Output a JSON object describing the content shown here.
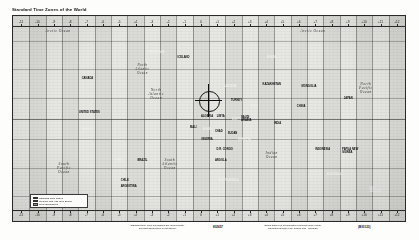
{
  "page": {
    "title": "Standard Time Zones of the World",
    "background_color": "#fdfdfc"
  },
  "map": {
    "frame_color": "#2a2a2a",
    "ocean_color": "#f4f4f1",
    "land_color": "#4a4a4a",
    "band_light": "#d8d8d4",
    "band_dark": "#bdbdb8",
    "projection_note": "Mercator-style world map with vertical time zone bands"
  },
  "axis": {
    "top_labels": [
      "-11",
      "-10",
      "-9",
      "-8",
      "-7",
      "-6",
      "-5",
      "-4",
      "-3",
      "-2",
      "-1",
      "0",
      "+1",
      "+2",
      "+3",
      "+4",
      "+5",
      "+6",
      "+7",
      "+8",
      "+9",
      "+10",
      "+11",
      "+12"
    ],
    "bottom_labels": [
      "-11",
      "-10",
      "-9",
      "-8",
      "-7",
      "-6",
      "-5",
      "-4",
      "-3",
      "-2",
      "-1",
      "0",
      "+1",
      "+2",
      "+3",
      "+4",
      "+5",
      "+6",
      "+7",
      "+8",
      "+9",
      "+10",
      "+11",
      "+12"
    ]
  },
  "ocean_labels": [
    {
      "text": "Arctic Ocean",
      "x": 11.5,
      "y": 7.5,
      "size": 3.6
    },
    {
      "text": "Arctic Ocean",
      "x": 76.5,
      "y": 7.5,
      "size": 3.6
    },
    {
      "text": "North\nPacific\nOcean",
      "x": 90.0,
      "y": 35.0,
      "size": 3.6
    },
    {
      "text": "North\nAtlantic\nOcean",
      "x": 36.5,
      "y": 38.0,
      "size": 3.6
    },
    {
      "text": "South\nPacific\nOcean",
      "x": 13.0,
      "y": 74.0,
      "size": 3.6
    },
    {
      "text": "South\nAtlantic\nOcean",
      "x": 40.0,
      "y": 72.0,
      "size": 3.6
    },
    {
      "text": "Indian\nOcean",
      "x": 66.0,
      "y": 68.0,
      "size": 3.6
    },
    {
      "text": "North\nAtlantic\nOcean",
      "x": 33.0,
      "y": 26.0,
      "size": 3.2
    }
  ],
  "country_labels": [
    {
      "text": "GREENLAND",
      "x": 36.5,
      "y": 17.5
    },
    {
      "text": "CANADA",
      "x": 19.0,
      "y": 30.0
    },
    {
      "text": "UNITED STATES",
      "x": 19.5,
      "y": 47.0
    },
    {
      "text": "MEXICO",
      "x": 19.0,
      "y": 55.0
    },
    {
      "text": "BRAZIL",
      "x": 33.0,
      "y": 70.0
    },
    {
      "text": "ARGENTINA",
      "x": 29.5,
      "y": 83.0
    },
    {
      "text": "RUSSIA",
      "x": 66.0,
      "y": 20.0
    },
    {
      "text": "CHINA",
      "x": 73.5,
      "y": 44.0
    },
    {
      "text": "INDIA",
      "x": 67.5,
      "y": 52.0
    },
    {
      "text": "AUSTRALIA",
      "x": 82.0,
      "y": 77.0
    },
    {
      "text": "ALGERIA",
      "x": 49.5,
      "y": 49.0
    },
    {
      "text": "LIBYA",
      "x": 53.0,
      "y": 49.0
    },
    {
      "text": "EGYPT",
      "x": 57.0,
      "y": 50.0
    },
    {
      "text": "SUDAN",
      "x": 56.0,
      "y": 57.0
    },
    {
      "text": "CHAD",
      "x": 52.5,
      "y": 56.0
    },
    {
      "text": "NIGER",
      "x": 49.5,
      "y": 55.0
    },
    {
      "text": "MALI",
      "x": 46.0,
      "y": 54.0
    },
    {
      "text": "NIGERIA",
      "x": 49.5,
      "y": 60.0
    },
    {
      "text": "ETHIOPIA",
      "x": 59.0,
      "y": 60.0
    },
    {
      "text": "D.R. CONGO",
      "x": 54.0,
      "y": 65.0
    },
    {
      "text": "ANGOLA",
      "x": 53.0,
      "y": 70.0
    },
    {
      "text": "SOUTH AFRICA",
      "x": 55.0,
      "y": 80.0
    },
    {
      "text": "KAZAKHSTAN",
      "x": 66.0,
      "y": 33.0
    },
    {
      "text": "MONGOLIA",
      "x": 75.5,
      "y": 34.0
    },
    {
      "text": "IRAN",
      "x": 61.5,
      "y": 44.0
    },
    {
      "text": "SAUDI\nARABIA",
      "x": 59.5,
      "y": 50.0
    },
    {
      "text": "TURKEY",
      "x": 57.0,
      "y": 41.0
    },
    {
      "text": "UKRAINE",
      "x": 55.5,
      "y": 34.0
    },
    {
      "text": "INDONESIA",
      "x": 79.0,
      "y": 65.0
    },
    {
      "text": "JAPAN",
      "x": 85.5,
      "y": 40.0
    },
    {
      "text": "PERU",
      "x": 27.0,
      "y": 70.0
    },
    {
      "text": "CHILE",
      "x": 28.5,
      "y": 80.0
    },
    {
      "text": "ICELAND",
      "x": 43.5,
      "y": 20.0
    },
    {
      "text": "NEW\nZEALAND",
      "x": 92.5,
      "y": 85.0
    },
    {
      "text": "PAPUA NEW\nGUINEA",
      "x": 86.0,
      "y": 66.0
    }
  ],
  "greenwich_marker": {
    "label": "Prime Meridian",
    "x": 49.8,
    "y": 41.0,
    "radius": 9.5
  },
  "legend": {
    "title": "Zone\nBoundaries",
    "rows": [
      {
        "label": "Standard Time Zones",
        "swatch": "#bdbdb8"
      },
      {
        "label": "Irregular and Half-hour Zones",
        "swatch": "#d8d8d4"
      },
      {
        "label": "Zone Boundaries",
        "swatch": "#8e8e8a"
      }
    ]
  },
  "footer": {
    "left_caption": "Standard time zone boundaries are approximate.\nDaylight saving time is not shown.",
    "left_number": "802657",
    "right_caption": "Zones based on Coordinated Universal Time (UTC).\nInternational Date Line follows 180° meridian.",
    "right_number": "(B00123)"
  }
}
